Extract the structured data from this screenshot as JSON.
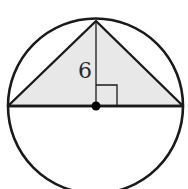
{
  "diagram": {
    "height_label": "6",
    "colors": {
      "stroke": "#1a1a1a",
      "triangle_fill": "#e8e8e8",
      "background": "#ffffff",
      "center_dot": "#000000"
    },
    "geometry": {
      "circle": {
        "cx": 95.5,
        "cy": 106,
        "r": 87.5
      },
      "triangle": [
        [
          8,
          106
        ],
        [
          96,
          21
        ],
        [
          183,
          106
        ]
      ],
      "height_segment": [
        [
          96,
          21
        ],
        [
          96,
          106
        ]
      ],
      "right_angle_marker": {
        "x": 96,
        "y": 85,
        "size": 21
      }
    }
  }
}
